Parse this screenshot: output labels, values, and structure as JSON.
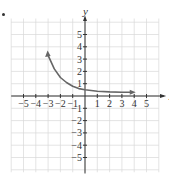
{
  "chart_data": {
    "type": "line",
    "title": "",
    "xlabel": "x",
    "ylabel": "y",
    "xlim": [
      -5,
      5
    ],
    "ylim": [
      -5,
      5
    ],
    "grid": true,
    "x_ticks": [
      "-5",
      "-4",
      "-3",
      "-2",
      "-1",
      "1",
      "2",
      "3",
      "4",
      "5"
    ],
    "y_ticks": [
      "5",
      "4",
      "3",
      "2",
      "1",
      "-1",
      "-2",
      "-3",
      "-4",
      "-5"
    ],
    "series": [
      {
        "name": "curve",
        "description": "Decreasing exponential-type curve with arrows at both ends, approaching y≈0.3 asymptotically",
        "x": [
          -3,
          -2.5,
          -2,
          -1.5,
          -1,
          -0.5,
          0,
          1,
          2,
          3,
          3.8
        ],
        "y": [
          3.3,
          2.2,
          1.5,
          1.1,
          0.8,
          0.6,
          0.5,
          0.38,
          0.33,
          0.31,
          0.3
        ],
        "color": "#666666",
        "arrows": [
          "start",
          "end"
        ]
      }
    ]
  },
  "labels": {
    "x_axis": "x",
    "y_axis": "y"
  },
  "colors": {
    "axis": "#333333",
    "grid": "#d9d9d9",
    "curve": "#666666"
  }
}
